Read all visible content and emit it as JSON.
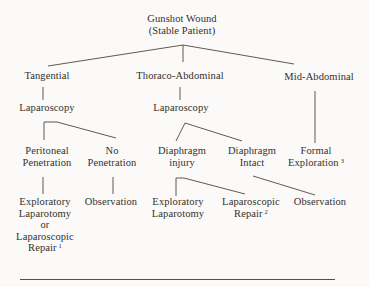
{
  "page": {
    "background_color": "#fbfaf8",
    "text_color": "#34302b",
    "line_color": "#4c4841"
  },
  "flowchart": {
    "title": "Gunshot Wound (Stable Patient)",
    "nodes": {
      "root": {
        "lines": [
          "Gunshot Wound",
          "(Stable Patient)"
        ]
      },
      "tangential": {
        "label": "Tangential"
      },
      "thoraco_abdominal": {
        "label": "Thoraco-Abdominal"
      },
      "mid_abdominal": {
        "label": "Mid-Abdominal"
      },
      "laparoscopy_left": {
        "label": "Laparoscopy"
      },
      "laparoscopy_mid": {
        "label": "Laparoscopy"
      },
      "peritoneal_penetration": {
        "lines": [
          "Peritoneal",
          "Penetration"
        ]
      },
      "no_penetration": {
        "lines": [
          "No",
          "Penetration"
        ]
      },
      "diaphragm_injury": {
        "lines": [
          "Diaphragm",
          "injury"
        ]
      },
      "diaphragm_intact": {
        "lines": [
          "Diaphragm",
          "Intact"
        ]
      },
      "formal_exploration": {
        "line1": "Formal",
        "line2": "Exploration",
        "footnote": "3"
      },
      "exploratory_or_laparoscopic": {
        "lines": [
          "Exploratory",
          "Laparotomy",
          "or",
          "Laparoscopic"
        ],
        "last_line": "Repair",
        "footnote": "1"
      },
      "observation_left": {
        "label": "Observation"
      },
      "exploratory_laparotomy": {
        "lines": [
          "Exploratory",
          "Laparotomy"
        ]
      },
      "laparoscopic_repair": {
        "line1": "Laparoscopic",
        "line2": "Repair",
        "footnote": "2"
      },
      "observation_right": {
        "label": "Observation"
      }
    },
    "edges": [
      {
        "from": "root",
        "to": "tangential"
      },
      {
        "from": "root",
        "to": "thoraco_abdominal"
      },
      {
        "from": "root",
        "to": "mid_abdominal"
      },
      {
        "from": "tangential",
        "to": "laparoscopy_left"
      },
      {
        "from": "thoraco_abdominal",
        "to": "laparoscopy_mid"
      },
      {
        "from": "mid_abdominal",
        "to": "formal_exploration"
      },
      {
        "from": "laparoscopy_left",
        "to": "peritoneal_penetration"
      },
      {
        "from": "laparoscopy_left",
        "to": "no_penetration"
      },
      {
        "from": "laparoscopy_mid",
        "to": "diaphragm_injury"
      },
      {
        "from": "laparoscopy_mid",
        "to": "diaphragm_intact"
      },
      {
        "from": "peritoneal_penetration",
        "to": "exploratory_or_laparoscopic"
      },
      {
        "from": "no_penetration",
        "to": "observation_left"
      },
      {
        "from": "diaphragm_injury",
        "to": "exploratory_laparotomy"
      },
      {
        "from": "diaphragm_injury",
        "to": "laparoscopic_repair"
      },
      {
        "from": "diaphragm_intact",
        "to": "observation_right"
      }
    ]
  }
}
